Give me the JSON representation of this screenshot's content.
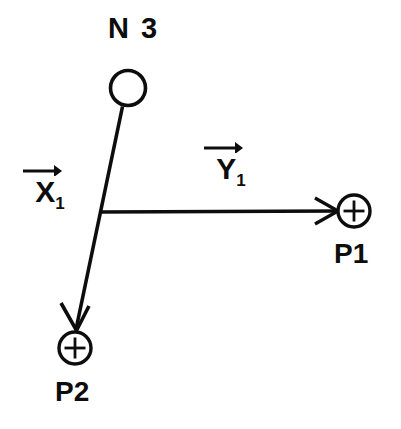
{
  "diagram": {
    "title": "N 3",
    "background_color": "#ffffff",
    "stroke_color": "#0d0d0d",
    "nodes": [
      {
        "id": "n3",
        "label": "N 3",
        "type": "open-circle",
        "cx": 128,
        "cy": 88,
        "r": 18
      },
      {
        "id": "p1",
        "label": "P1",
        "type": "plus-circle",
        "cx": 354,
        "cy": 211,
        "r": 16
      },
      {
        "id": "p2",
        "label": "P2",
        "type": "plus-circle",
        "cx": 75,
        "cy": 348,
        "r": 16
      }
    ],
    "junction": {
      "id": "junction-vertex",
      "x": 100,
      "y": 212
    },
    "vectors": [
      {
        "id": "x1",
        "base": "X",
        "subscript": "1",
        "overbar": "arrow-right",
        "from": "n3",
        "to": "p2",
        "arrowhead": "open-v"
      },
      {
        "id": "y1",
        "base": "Y",
        "subscript": "1",
        "overbar": "arrow-right",
        "from": "junction",
        "to": "p1",
        "arrowhead": "open-v"
      }
    ],
    "edges": [
      {
        "id": "n3-to-p2",
        "x1": 122,
        "y1": 106,
        "x2": 75,
        "y2": 330
      },
      {
        "id": "junction-to-p1",
        "x1": 100,
        "y1": 212,
        "x2": 338,
        "y2": 211
      }
    ]
  }
}
